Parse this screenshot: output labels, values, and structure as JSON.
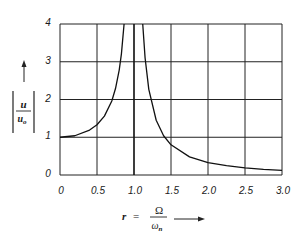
{
  "chart_data": {
    "type": "line",
    "title": "",
    "xlabel": "r = Ω / ω_n",
    "ylabel": "|u / u_o|",
    "xlim": [
      0,
      3.0
    ],
    "ylim": [
      0,
      4
    ],
    "grid": true,
    "legend": null,
    "x_ticks": [
      "0",
      "0.5",
      "1.0",
      "1.5",
      "2.0",
      "2.5",
      "3.0"
    ],
    "y_ticks": [
      "0",
      "1",
      "2",
      "3",
      "4"
    ],
    "asymptote_x": 1.0,
    "series": [
      {
        "name": "|u/u_o| (r < 1)",
        "x": [
          0,
          0.2,
          0.4,
          0.5,
          0.6,
          0.7,
          0.75,
          0.8,
          0.83,
          0.866
        ],
        "y": [
          1.0,
          1.04,
          1.19,
          1.33,
          1.56,
          1.96,
          2.29,
          2.78,
          3.21,
          4.0
        ]
      },
      {
        "name": "|u/u_o| (r > 1)",
        "x": [
          1.118,
          1.15,
          1.2,
          1.3,
          1.4,
          1.5,
          1.75,
          2.0,
          2.25,
          2.5,
          2.75,
          3.0
        ],
        "y": [
          4.0,
          3.1,
          2.27,
          1.45,
          1.04,
          0.8,
          0.48,
          0.33,
          0.25,
          0.19,
          0.15,
          0.125
        ]
      }
    ]
  },
  "labels": {
    "y_label_numerator": "u",
    "y_label_denominator": "u",
    "y_label_denominator_sub": "o",
    "x_label_var": "r",
    "x_label_eq": "=",
    "x_label_numerator": "Ω",
    "x_label_denominator": "ω",
    "x_label_denominator_sub": "n"
  }
}
